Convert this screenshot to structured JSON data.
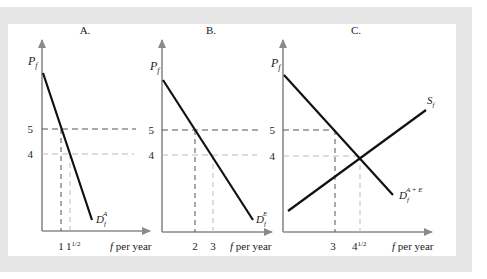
{
  "figure": {
    "panels": [
      {
        "id": "A",
        "title": "A.",
        "y_axis_label": "P",
        "y_axis_sub": "f",
        "x_axis_label": "f per year",
        "y_ticks": [
          "5",
          "4"
        ],
        "x_ticks": [
          "1",
          "1½"
        ],
        "x_tick_main": "1",
        "x_tick_half_whole": "1",
        "x_tick_half_frac": "1/2",
        "curve_label": "D",
        "curve_sub": "f",
        "curve_sup": "A"
      },
      {
        "id": "B",
        "title": "B.",
        "y_axis_label": "P",
        "y_axis_sub": "f",
        "x_axis_label": "f per year",
        "y_ticks": [
          "5",
          "4"
        ],
        "x_ticks": [
          "2",
          "3"
        ],
        "curve_label": "D",
        "curve_sub": "f",
        "curve_sup": "E"
      },
      {
        "id": "C",
        "title": "C.",
        "y_axis_label": "P",
        "y_axis_sub": "f",
        "x_axis_label": "f per year",
        "y_ticks": [
          "5",
          "4"
        ],
        "x_ticks": [
          "3",
          "4½"
        ],
        "x_tick_half_whole": "4",
        "x_tick_half_frac": "1/2",
        "demand_label": "D",
        "demand_sub": "f",
        "demand_sup": "A + E",
        "supply_label": "S",
        "supply_sub": "f"
      }
    ],
    "colors": {
      "frame": "#e6e6e6",
      "axis": "#8a8a8a",
      "curve": "#111111",
      "dash_dark": "#555555",
      "dash_light": "#bbbbbb"
    }
  }
}
